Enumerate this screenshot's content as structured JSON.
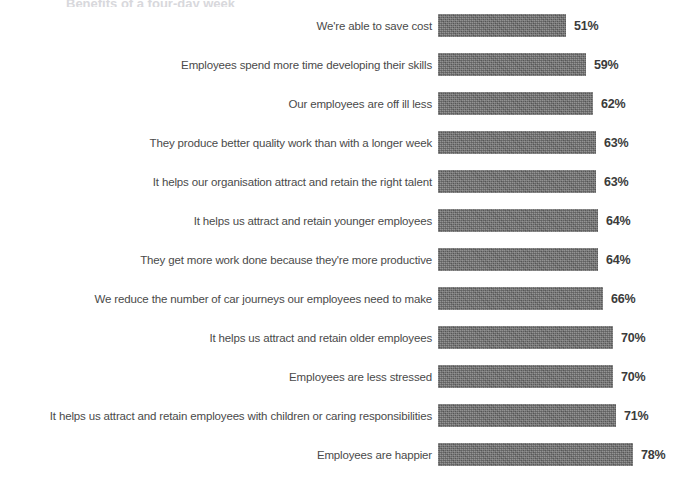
{
  "chart": {
    "title_remnant": "Benefits of a four-day week",
    "value_suffix": "%",
    "bar_color": "#6d6d6d",
    "label_color": "#4a4a4a",
    "value_color": "#3b3b3b",
    "background": "#ffffff"
  },
  "chart_data": {
    "type": "bar",
    "orientation": "horizontal",
    "title": "",
    "subtitle": "",
    "xlabel": "",
    "ylabel": "",
    "xlim": [
      0,
      100
    ],
    "grid": false,
    "legend": "none",
    "value_unit": "%",
    "data_labels": true,
    "categories": [
      "We're able to save cost",
      "Employees spend more time developing their skills",
      "Our employees are off ill less",
      "They produce better quality work than with a longer week",
      "It helps our organisation attract and retain the right talent",
      "It helps us attract and retain younger employees",
      "They get more work done because they're more productive",
      "We reduce the number of car journeys our employees need to make",
      "It helps us attract and retain older employees",
      "Employees are less stressed",
      "It helps us attract and retain employees with children or caring responsibilities",
      "Employees are happier"
    ],
    "values": [
      51,
      59,
      62,
      63,
      63,
      64,
      64,
      66,
      70,
      70,
      71,
      78
    ],
    "value_labels": [
      "51%",
      "59%",
      "62%",
      "63%",
      "63%",
      "64%",
      "64%",
      "66%",
      "70%",
      "70%",
      "71%",
      "78%"
    ]
  }
}
